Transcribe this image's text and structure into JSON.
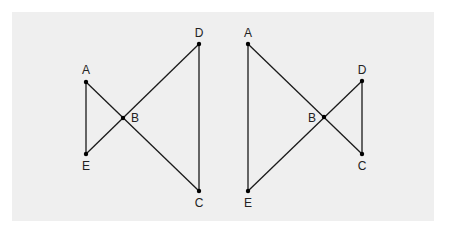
{
  "diagram": {
    "background_color": "#efefef",
    "line_color": "#1a1a1a",
    "figures": [
      {
        "name": "left-figure",
        "points": {
          "A": {
            "x": 86,
            "y": 82,
            "label": "A",
            "lx": 86,
            "ly": 74,
            "anchor": "middle"
          },
          "B": {
            "x": 123,
            "y": 118,
            "label": "B",
            "lx": 131,
            "ly": 122,
            "anchor": "start"
          },
          "C": {
            "x": 199,
            "y": 191,
            "label": "C",
            "lx": 199,
            "ly": 207,
            "anchor": "middle"
          },
          "D": {
            "x": 199,
            "y": 44,
            "label": "D",
            "lx": 199,
            "ly": 37,
            "anchor": "middle"
          },
          "E": {
            "x": 86,
            "y": 154,
            "label": "E",
            "lx": 86,
            "ly": 170,
            "anchor": "middle"
          }
        },
        "segments": [
          [
            "A",
            "E"
          ],
          [
            "A",
            "C"
          ],
          [
            "E",
            "D"
          ],
          [
            "D",
            "C"
          ]
        ]
      },
      {
        "name": "right-figure",
        "points": {
          "A": {
            "x": 248,
            "y": 44,
            "label": "A",
            "lx": 248,
            "ly": 37,
            "anchor": "middle"
          },
          "B": {
            "x": 324,
            "y": 117,
            "label": "B",
            "lx": 316,
            "ly": 122,
            "anchor": "end"
          },
          "C": {
            "x": 362,
            "y": 154,
            "label": "C",
            "lx": 362,
            "ly": 170,
            "anchor": "middle"
          },
          "D": {
            "x": 362,
            "y": 81,
            "label": "D",
            "lx": 362,
            "ly": 74,
            "anchor": "middle"
          },
          "E": {
            "x": 248,
            "y": 191,
            "label": "E",
            "lx": 248,
            "ly": 207,
            "anchor": "middle"
          }
        },
        "segments": [
          [
            "A",
            "E"
          ],
          [
            "A",
            "C"
          ],
          [
            "E",
            "D"
          ],
          [
            "D",
            "C"
          ]
        ]
      }
    ]
  }
}
